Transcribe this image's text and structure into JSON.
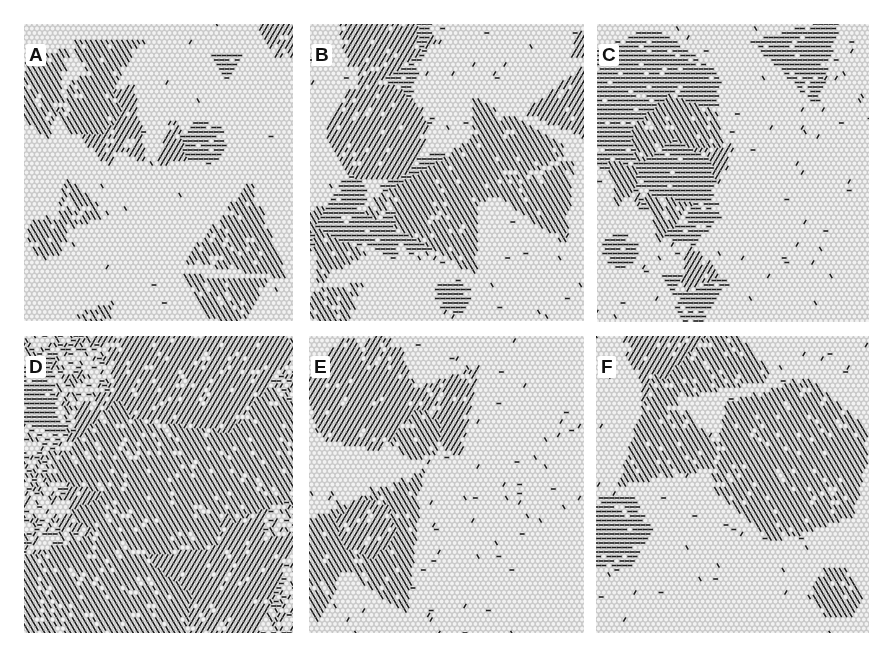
{
  "figure": {
    "panels": [
      {
        "label": "A",
        "density": 0.14,
        "seed": 11,
        "domains": 14
      },
      {
        "label": "B",
        "density": 0.4,
        "seed": 23,
        "domains": 16
      },
      {
        "label": "C",
        "density": 0.62,
        "seed": 37,
        "domains": 14
      },
      {
        "label": "D",
        "density": 0.92,
        "seed": 41,
        "domains": 10
      },
      {
        "label": "E",
        "density": 0.78,
        "seed": 53,
        "domains": 7
      },
      {
        "label": "F",
        "density": 0.55,
        "seed": 67,
        "domains": 6
      }
    ]
  },
  "colors": {
    "background": "#ffffff",
    "lattice_light": "#c9c9c9",
    "cell_fill": "#f2f2f2",
    "dash": "#1a1a1a"
  }
}
